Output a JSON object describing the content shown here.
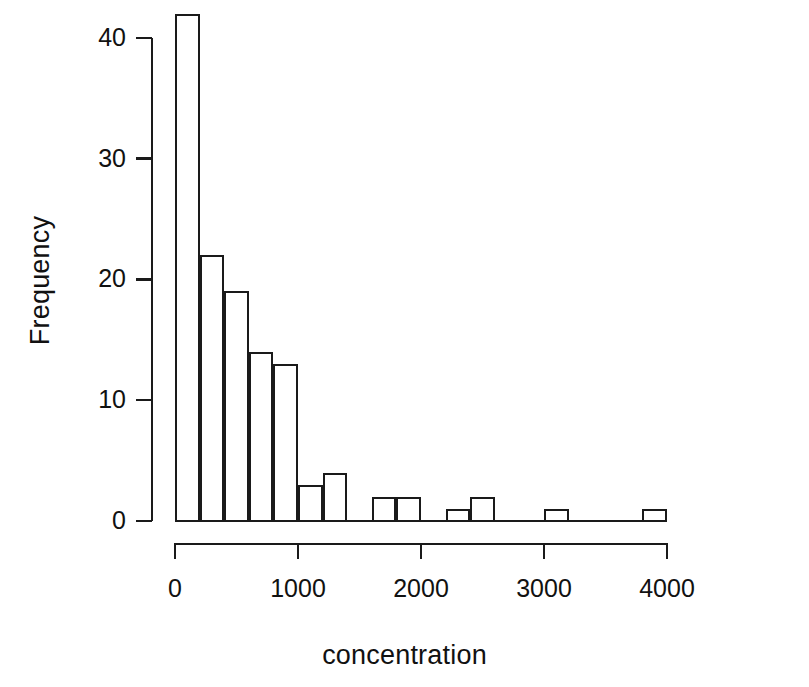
{
  "chart_data": {
    "type": "bar",
    "title": "",
    "xlabel": "concentration",
    "ylabel": "Frequency",
    "xlim": [
      0,
      4000
    ],
    "ylim": [
      0,
      42
    ],
    "grid": false,
    "legend": "none",
    "bin_width": 200,
    "x_ticks": [
      0,
      1000,
      2000,
      3000,
      4000
    ],
    "x_tick_labels": [
      "0",
      "1000",
      "2000",
      "3000",
      "4000"
    ],
    "y_ticks": [
      0,
      10,
      20,
      30,
      40
    ],
    "y_tick_labels": [
      "0",
      "10",
      "20",
      "30",
      "40"
    ],
    "bins": [
      {
        "start": 0,
        "end": 200,
        "value": 42
      },
      {
        "start": 200,
        "end": 400,
        "value": 22
      },
      {
        "start": 400,
        "end": 600,
        "value": 19
      },
      {
        "start": 600,
        "end": 800,
        "value": 14
      },
      {
        "start": 800,
        "end": 1000,
        "value": 13
      },
      {
        "start": 1000,
        "end": 1200,
        "value": 3
      },
      {
        "start": 1200,
        "end": 1400,
        "value": 4
      },
      {
        "start": 1400,
        "end": 1600,
        "value": 0
      },
      {
        "start": 1600,
        "end": 1800,
        "value": 2
      },
      {
        "start": 1800,
        "end": 2000,
        "value": 2
      },
      {
        "start": 2000,
        "end": 2200,
        "value": 0
      },
      {
        "start": 2200,
        "end": 2400,
        "value": 1
      },
      {
        "start": 2400,
        "end": 2600,
        "value": 2
      },
      {
        "start": 2600,
        "end": 2800,
        "value": 0
      },
      {
        "start": 2800,
        "end": 3000,
        "value": 0
      },
      {
        "start": 3000,
        "end": 3200,
        "value": 1
      },
      {
        "start": 3200,
        "end": 3400,
        "value": 0
      },
      {
        "start": 3400,
        "end": 3600,
        "value": 0
      },
      {
        "start": 3600,
        "end": 3800,
        "value": 0
      },
      {
        "start": 3800,
        "end": 4000,
        "value": 1
      }
    ],
    "categories": [
      "0-200",
      "200-400",
      "400-600",
      "600-800",
      "800-1000",
      "1000-1200",
      "1200-1400",
      "1400-1600",
      "1600-1800",
      "1800-2000",
      "2000-2200",
      "2200-2400",
      "2400-2600",
      "2600-2800",
      "2800-3000",
      "3000-3200",
      "3200-3400",
      "3400-3600",
      "3600-3800",
      "3800-4000"
    ],
    "values": [
      42,
      22,
      19,
      14,
      13,
      3,
      4,
      0,
      2,
      2,
      0,
      1,
      2,
      0,
      0,
      1,
      0,
      0,
      0,
      1
    ],
    "colors": {
      "line": "#1a1a1a",
      "background": "#ffffff",
      "fill": "transparent"
    }
  }
}
